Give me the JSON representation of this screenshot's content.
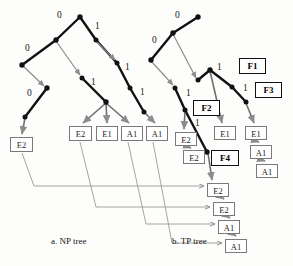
{
  "figure": {
    "width": 293,
    "height": 266,
    "background": "#fdfdfc",
    "captions": [
      {
        "id": "np",
        "text": "a. NP tree",
        "x": 68,
        "y": 240
      },
      {
        "id": "tp",
        "text": "b. TP tree",
        "x": 190,
        "y": 240
      }
    ]
  },
  "colors": {
    "dark_edge": "#111111",
    "gray_edge": "#8c8c8c",
    "box_border": "#7a7a7a",
    "fbox_border": "#111111",
    "text": "#1d1d1d",
    "page_background": "#fdfdfc"
  },
  "np_tree": {
    "name": "NP tree",
    "nodes": [
      {
        "id": "np-root",
        "x": 80,
        "y": 17
      },
      {
        "id": "np-n1",
        "x": 56,
        "y": 40
      },
      {
        "id": "np-n2",
        "x": 96,
        "y": 40
      },
      {
        "id": "np-n3",
        "x": 22,
        "y": 65
      },
      {
        "id": "np-n4",
        "x": 47,
        "y": 88
      },
      {
        "id": "np-n5",
        "x": 25,
        "y": 117
      },
      {
        "id": "np-n6",
        "x": 82,
        "y": 78
      },
      {
        "id": "np-n7",
        "x": 106,
        "y": 102
      },
      {
        "id": "np-n8",
        "x": 117,
        "y": 63
      },
      {
        "id": "np-n9",
        "x": 130,
        "y": 88
      },
      {
        "id": "np-n10",
        "x": 142,
        "y": 110
      }
    ],
    "dark_edges": [
      {
        "from": "np-root",
        "to": "np-n1"
      },
      {
        "from": "np-root",
        "to": "np-n2"
      },
      {
        "from": "np-n1",
        "to": "np-n3"
      },
      {
        "from": "np-n4",
        "to": "np-n5"
      },
      {
        "from": "np-n2",
        "to": "np-n8"
      },
      {
        "from": "np-n8",
        "to": "np-n9"
      },
      {
        "from": "np-n9",
        "to": "np-n10"
      },
      {
        "from": "np-n6",
        "to": "np-n7"
      }
    ],
    "gray_edges": [
      {
        "from": "np-n3",
        "to": "np-n4"
      },
      {
        "from": "np-n1",
        "to": "np-n6"
      }
    ],
    "edge_labels": [
      {
        "text": "0",
        "x": 61,
        "y": 16
      },
      {
        "text": "1",
        "x": 96,
        "y": 26
      },
      {
        "text": "0",
        "x": 27,
        "y": 48
      },
      {
        "text": "0",
        "x": 29,
        "y": 93
      },
      {
        "text": "1",
        "x": 94,
        "y": 82
      },
      {
        "text": "1",
        "x": 128,
        "y": 67
      },
      {
        "text": "1",
        "x": 143,
        "y": 92
      }
    ],
    "leaves": [
      {
        "id": "np-leaf-1",
        "label": "E2",
        "x": 10,
        "y": 137,
        "w": 23,
        "h": 15,
        "from": "np-n5"
      },
      {
        "id": "np-leaf-2",
        "label": "E2",
        "x": 69,
        "y": 126,
        "w": 23,
        "h": 15,
        "from": "np-n7"
      },
      {
        "id": "np-leaf-3",
        "label": "E1",
        "x": 96,
        "y": 126,
        "w": 22,
        "h": 15,
        "from": "np-n7"
      },
      {
        "id": "np-leaf-4",
        "label": "A1",
        "x": 121,
        "y": 126,
        "w": 22,
        "h": 15,
        "from": "np-n7"
      },
      {
        "id": "np-leaf-5",
        "label": "A1",
        "x": 146,
        "y": 126,
        "w": 22,
        "h": 15,
        "from": "np-n10"
      }
    ]
  },
  "tp_tree": {
    "name": "TP tree",
    "nodes": [
      {
        "id": "tp-root",
        "x": 198,
        "y": 17
      },
      {
        "id": "tp-n1",
        "x": 173,
        "y": 33
      },
      {
        "id": "tp-n2",
        "x": 151,
        "y": 60
      },
      {
        "id": "tp-n3",
        "x": 175,
        "y": 88
      },
      {
        "id": "tp-n4",
        "x": 185,
        "y": 110
      },
      {
        "id": "tp-n5",
        "x": 207,
        "y": 152
      },
      {
        "id": "tp-n6",
        "x": 210,
        "y": 70
      },
      {
        "id": "tp-n7",
        "x": 232,
        "y": 87
      },
      {
        "id": "tp-n8",
        "x": 246,
        "y": 102
      }
    ],
    "dark_edges": [
      {
        "from": "tp-root",
        "to": "tp-n1"
      },
      {
        "from": "tp-n1",
        "to": "tp-n2"
      },
      {
        "from": "tp-n3",
        "to": "tp-n4"
      },
      {
        "from": "tp-n4",
        "to": "tp-n5"
      },
      {
        "from": "tp-n6",
        "to": "tp-n7"
      },
      {
        "from": "tp-n7",
        "to": "tp-n8"
      },
      {
        "from": "tp-n6",
        "to": "tp-n210"
      }
    ],
    "gray_edges": [
      {
        "from": "tp-n1",
        "to": "tp-n6"
      },
      {
        "from": "tp-n2",
        "to": "tp-n3"
      }
    ],
    "edge_labels": [
      {
        "text": "0",
        "x": 178,
        "y": 15
      },
      {
        "text": "0",
        "x": 155,
        "y": 40
      },
      {
        "text": "1",
        "x": 219,
        "y": 67
      },
      {
        "text": "1",
        "x": 189,
        "y": 93
      },
      {
        "text": "1",
        "x": 245,
        "y": 88
      },
      {
        "text": "1",
        "x": 197,
        "y": 122
      }
    ],
    "f_labels": [
      {
        "id": "f1",
        "label": "F1",
        "x": 239,
        "y": 58,
        "w": 27,
        "h": 16
      },
      {
        "id": "f2",
        "label": "F2",
        "x": 193,
        "y": 100,
        "w": 27,
        "h": 16
      },
      {
        "id": "f3",
        "label": "F3",
        "x": 255,
        "y": 82,
        "w": 27,
        "h": 16
      },
      {
        "id": "f4",
        "label": "F4",
        "x": 211,
        "y": 150,
        "w": 28,
        "h": 16
      }
    ],
    "leaves": [
      {
        "id": "tp-leaf-e2a",
        "label": "E2",
        "x": 175,
        "y": 132,
        "w": 22,
        "h": 14
      },
      {
        "id": "tp-leaf-e2b",
        "label": "E2",
        "x": 183,
        "y": 150,
        "w": 22,
        "h": 14
      },
      {
        "id": "tp-leaf-e1a",
        "label": "E1",
        "x": 214,
        "y": 126,
        "w": 22,
        "h": 14
      },
      {
        "id": "tp-leaf-e1b",
        "label": "E1",
        "x": 245,
        "y": 126,
        "w": 22,
        "h": 14
      },
      {
        "id": "tp-leaf-a1a",
        "label": "A1",
        "x": 250,
        "y": 145,
        "w": 22,
        "h": 14
      },
      {
        "id": "tp-leaf-a1b",
        "label": "A1",
        "x": 256,
        "y": 164,
        "w": 22,
        "h": 14
      }
    ]
  },
  "result_chain": {
    "name": "result list",
    "items": [
      {
        "id": "res-1",
        "label": "E2",
        "x": 207,
        "y": 183,
        "w": 22,
        "h": 14
      },
      {
        "id": "res-2",
        "label": "E2",
        "x": 213,
        "y": 202,
        "w": 22,
        "h": 14
      },
      {
        "id": "res-3",
        "label": "A1",
        "x": 218,
        "y": 220,
        "w": 22,
        "h": 14
      },
      {
        "id": "res-4",
        "label": "A1",
        "x": 225,
        "y": 239,
        "w": 22,
        "h": 14
      }
    ],
    "links": [
      {
        "from": "np-leaf-1",
        "to": "res-1"
      },
      {
        "from": "np-leaf-2",
        "to": "res-2"
      },
      {
        "from": "np-leaf-4",
        "to": "res-3"
      },
      {
        "from": "np-leaf-5",
        "to": "res-4"
      }
    ]
  }
}
